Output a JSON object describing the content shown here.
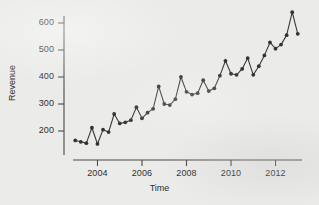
{
  "chart_data": {
    "type": "line",
    "title": "",
    "subtitle": "",
    "xlabel": "Time",
    "ylabel": "Revenue",
    "xlim": [
      2002.9,
      2013.1
    ],
    "ylim": [
      140,
      655
    ],
    "grid": false,
    "legend": null,
    "marker": "filled-circle",
    "line_color": "#3a3a3a",
    "marker_color": "#333333",
    "axis_color": "#4a4a4a",
    "background": "#ebebe9",
    "xticks": [
      2004,
      2006,
      2008,
      2010,
      2012
    ],
    "xtick_labels": [
      "2004",
      "2006",
      "2008",
      "2010",
      "2012"
    ],
    "yticks": [
      200,
      300,
      400,
      500,
      600
    ],
    "ytick_labels": [
      "200",
      "300",
      "400",
      "500",
      "600"
    ],
    "frequency_per_year": 4,
    "x": [
      2003.0,
      2003.25,
      2003.5,
      2003.75,
      2004.0,
      2004.25,
      2004.5,
      2004.75,
      2005.0,
      2005.25,
      2005.5,
      2005.75,
      2006.0,
      2006.25,
      2006.5,
      2006.75,
      2007.0,
      2007.25,
      2007.5,
      2007.75,
      2008.0,
      2008.25,
      2008.5,
      2008.75,
      2009.0,
      2009.25,
      2009.5,
      2009.75,
      2010.0,
      2010.25,
      2010.5,
      2010.75,
      2011.0,
      2011.25,
      2011.5,
      2011.75,
      2012.0,
      2012.25,
      2012.5,
      2012.75,
      2013.0
    ],
    "values": [
      165,
      160,
      155,
      212,
      152,
      205,
      196,
      263,
      228,
      232,
      240,
      288,
      247,
      268,
      282,
      365,
      300,
      296,
      318,
      400,
      345,
      335,
      340,
      388,
      348,
      358,
      405,
      460,
      412,
      408,
      430,
      470,
      408,
      440,
      480,
      528,
      505,
      520,
      555,
      640,
      560
    ],
    "series_name": "Revenue"
  }
}
